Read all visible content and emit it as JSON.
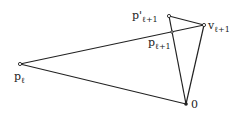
{
  "diagram": {
    "points": {
      "p_l": {
        "x": 20,
        "y": 64,
        "label": "p",
        "sub": "ℓ"
      },
      "v_l1": {
        "x": 204,
        "y": 25,
        "label": "v",
        "sub": "ℓ+1"
      },
      "p_prime_l1": {
        "x": 169,
        "y": 16,
        "label": "p'",
        "sub": "ℓ+1"
      },
      "p_l1": {
        "x": 172,
        "y": 32,
        "label": "p",
        "sub": "ℓ+1"
      },
      "origin": {
        "x": 186,
        "y": 104,
        "label": "0"
      }
    },
    "edges": [
      [
        "p_l",
        "v_l1"
      ],
      [
        "p_l",
        "origin"
      ],
      [
        "origin",
        "v_l1"
      ],
      [
        "origin",
        "p_prime_l1"
      ],
      [
        "p_prime_l1",
        "v_l1"
      ]
    ],
    "colors": {
      "line": "#222222",
      "background": "#ffffff"
    }
  }
}
